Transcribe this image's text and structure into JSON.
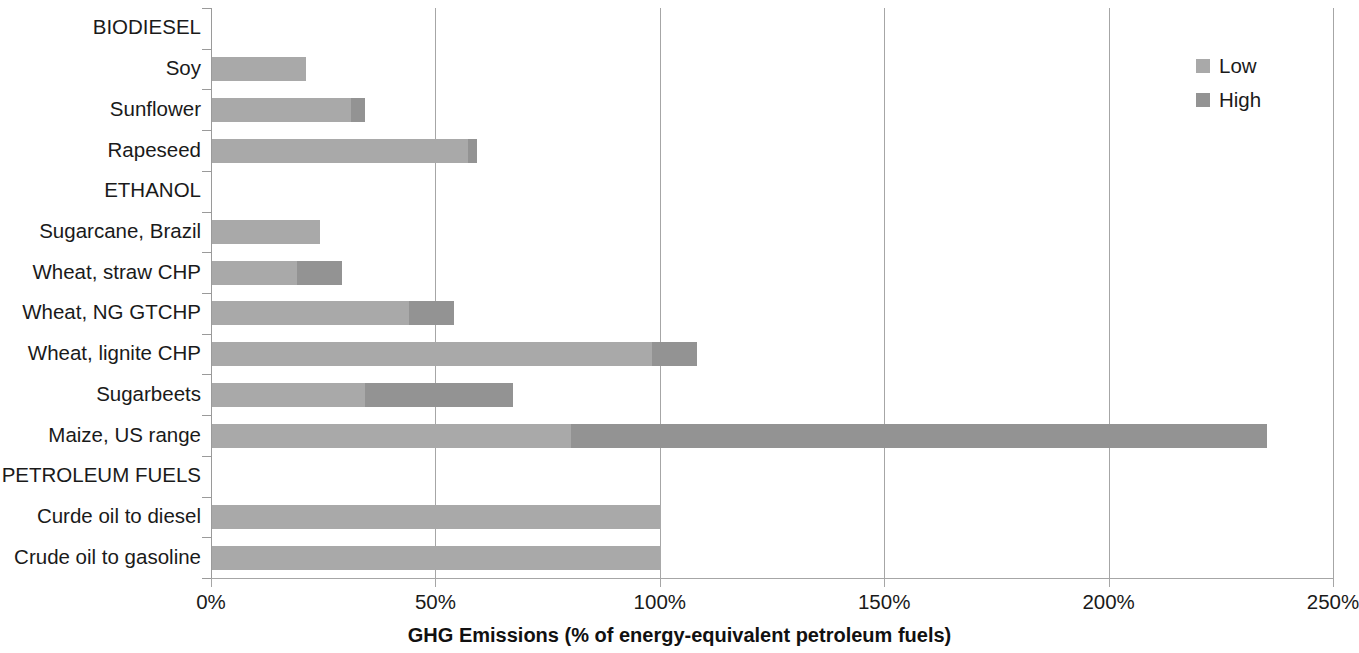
{
  "chart_data": {
    "type": "bar",
    "orientation": "horizontal",
    "stacked": true,
    "title": "",
    "xlabel": "GHG Emissions (% of energy-equivalent petroleum fuels)",
    "ylabel": "",
    "xlim": [
      0,
      250
    ],
    "xticks": [
      0,
      50,
      100,
      150,
      200,
      250
    ],
    "xtick_labels": [
      "0%",
      "50%",
      "100%",
      "150%",
      "200%",
      "250%"
    ],
    "grid": "vertical",
    "legend_position": "top-right",
    "legend": [
      "Low",
      "High"
    ],
    "colors": {
      "low": "#a9a9a9",
      "high": "#939393",
      "gridline": "#a6a6a6",
      "axis": "#9a9a9a",
      "text": "#1a1a1a",
      "background": "#ffffff"
    },
    "categories": [
      "BIODIESEL",
      "Soy",
      "Sunflower",
      "Rapeseed",
      "ETHANOL",
      "Sugarcane, Brazil",
      "Wheat, straw CHP",
      "Wheat, NG GTCHP",
      "Wheat, lignite CHP",
      "Sugarbeets",
      "Maize, US range",
      "PETROLEUM FUELS",
      "Curde oil to diesel",
      "Crude oil to gasoline"
    ],
    "series": [
      {
        "name": "Low",
        "values": [
          null,
          21,
          31,
          57,
          null,
          24,
          19,
          44,
          98,
          34,
          80,
          null,
          100,
          100
        ]
      },
      {
        "name": "High",
        "values": [
          null,
          21,
          34,
          59,
          null,
          24,
          29,
          54,
          108,
          67,
          235,
          null,
          100,
          100
        ]
      }
    ],
    "rows": [
      {
        "label": "BIODIESEL",
        "is_header": true,
        "low": null,
        "high": null
      },
      {
        "label": "Soy",
        "is_header": false,
        "low": 21,
        "high": 21
      },
      {
        "label": "Sunflower",
        "is_header": false,
        "low": 31,
        "high": 34
      },
      {
        "label": "Rapeseed",
        "is_header": false,
        "low": 57,
        "high": 59
      },
      {
        "label": "ETHANOL",
        "is_header": true,
        "low": null,
        "high": null
      },
      {
        "label": "Sugarcane, Brazil",
        "is_header": false,
        "low": 24,
        "high": 24
      },
      {
        "label": "Wheat, straw CHP",
        "is_header": false,
        "low": 19,
        "high": 29
      },
      {
        "label": "Wheat, NG GTCHP",
        "is_header": false,
        "low": 44,
        "high": 54
      },
      {
        "label": "Wheat, lignite CHP",
        "is_header": false,
        "low": 98,
        "high": 108
      },
      {
        "label": "Sugarbeets",
        "is_header": false,
        "low": 34,
        "high": 67
      },
      {
        "label": "Maize, US range",
        "is_header": false,
        "low": 80,
        "high": 235
      },
      {
        "label": "PETROLEUM FUELS",
        "is_header": true,
        "low": null,
        "high": null
      },
      {
        "label": "Curde oil to diesel",
        "is_header": false,
        "low": 100,
        "high": 100
      },
      {
        "label": "Crude oil to gasoline",
        "is_header": false,
        "low": 100,
        "high": 100
      }
    ]
  }
}
